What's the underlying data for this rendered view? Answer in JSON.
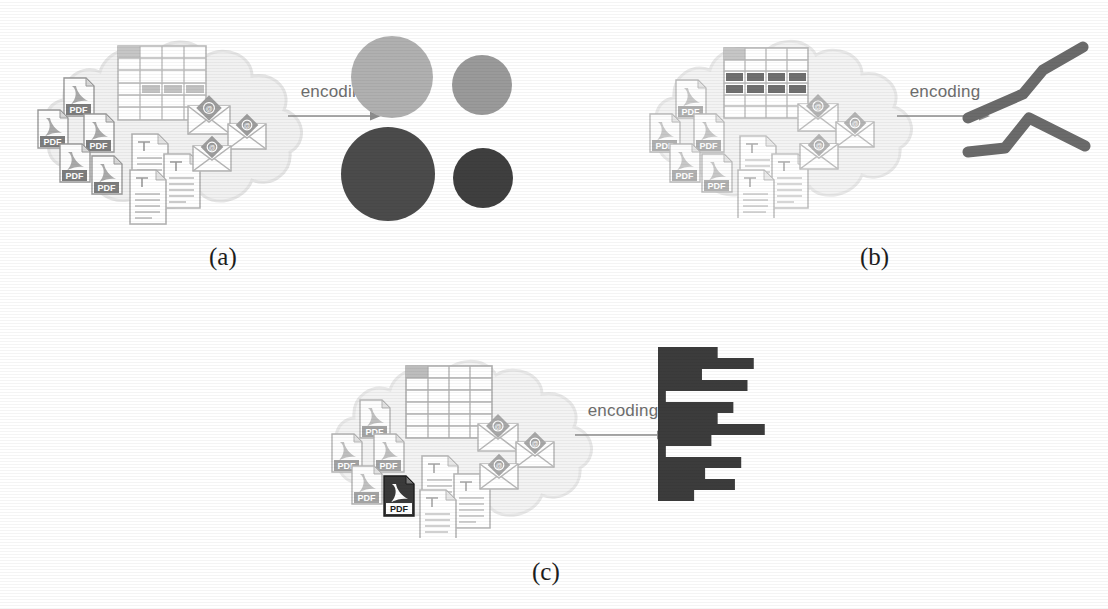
{
  "figure": {
    "caption_labels": [
      "(a)",
      "(b)",
      "(c)"
    ],
    "transform_label": "encoding",
    "background_color": "#ffffff",
    "ink_color": "#3a3a3a"
  },
  "panels": [
    {
      "id": "a",
      "label": "(a)",
      "arrow_label": "encoding",
      "source": {
        "name": "cloud-document-collection",
        "cloud_color": "#f0f0f0",
        "items": [
          {
            "type": "table",
            "label": "table-icon",
            "highlighted_rows": 0
          },
          {
            "type": "pdf",
            "label": "PDF",
            "count": 6,
            "highlighted": 0
          },
          {
            "type": "text-document",
            "label": "text-document-icon",
            "count": 4
          },
          {
            "type": "email",
            "label": "envelope-icon",
            "count": 3
          }
        ]
      },
      "output": {
        "encoding_type": "bubble",
        "name": "circle-glyph-encoding"
      },
      "chart_index": 0
    },
    {
      "id": "b",
      "label": "(b)",
      "arrow_label": "encoding",
      "source": {
        "name": "cloud-document-collection",
        "cloud_color": "#f2f2f2",
        "items": [
          {
            "type": "table",
            "label": "table-icon",
            "highlighted_rows": 2
          },
          {
            "type": "pdf",
            "label": "PDF",
            "count": 6,
            "highlighted": 0
          },
          {
            "type": "text-document",
            "label": "text-document-icon",
            "count": 4
          },
          {
            "type": "email",
            "label": "envelope-icon",
            "count": 3
          }
        ]
      },
      "output": {
        "encoding_type": "line",
        "name": "line-glyph-encoding"
      },
      "chart_index": 1
    },
    {
      "id": "c",
      "label": "(c)",
      "arrow_label": "encoding",
      "source": {
        "name": "cloud-document-collection",
        "cloud_color": "#f2f2f2",
        "items": [
          {
            "type": "table",
            "label": "table-icon",
            "highlighted_rows": 0
          },
          {
            "type": "pdf",
            "label": "PDF",
            "count": 6,
            "highlighted": 1
          },
          {
            "type": "text-document",
            "label": "text-document-icon",
            "count": 4
          },
          {
            "type": "email",
            "label": "envelope-icon",
            "count": 3
          }
        ]
      },
      "output": {
        "encoding_type": "bar",
        "name": "bar-glyph-encoding"
      },
      "chart_index": 2
    }
  ],
  "chart_data": [
    {
      "type": "scatter",
      "title": "",
      "xlabel": "",
      "ylabel": "",
      "legend": "none",
      "grid": false,
      "note": "Four filled circles (bubble glyphs) of two sizes and two gray tones",
      "points": [
        {
          "name": "circle-top-left",
          "cx": 392,
          "cy": 77,
          "r": 41,
          "color": "#b0b0b0"
        },
        {
          "name": "circle-top-right",
          "cx": 482,
          "cy": 85,
          "r": 30,
          "color": "#9a9a9a"
        },
        {
          "name": "circle-bottom-left",
          "cx": 388,
          "cy": 174,
          "r": 47,
          "color": "#4b4b4b"
        },
        {
          "name": "circle-bottom-right",
          "cx": 483,
          "cy": 178,
          "r": 30,
          "color": "#3f3f3f"
        }
      ]
    },
    {
      "type": "line",
      "title": "",
      "xlabel": "",
      "ylabel": "",
      "legend": "none",
      "grid": false,
      "stroke_color": "#6b6b6b",
      "stroke_width": 11,
      "note": "Two thick rounded polyline glyphs, upper series rising, lower series peaked",
      "series": [
        {
          "name": "upper-line",
          "points": [
            [
              968,
              118
            ],
            [
              1023,
              94
            ],
            [
              1043,
              70
            ],
            [
              1083,
              47
            ]
          ]
        },
        {
          "name": "lower-line",
          "points": [
            [
              968,
              152
            ],
            [
              1005,
              148
            ],
            [
              1029,
              118
            ],
            [
              1085,
              146
            ]
          ]
        }
      ]
    },
    {
      "type": "bar",
      "orientation": "horizontal",
      "title": "",
      "xlabel": "",
      "ylabel": "",
      "legend": "none",
      "grid": false,
      "bar_color": "#3c3c3c",
      "x_origin": 658,
      "y_top": 347,
      "bar_height": 11,
      "categories": [
        "b1",
        "b2",
        "b3",
        "b4",
        "b5",
        "b6",
        "b7",
        "b8",
        "b9",
        "b10",
        "b11",
        "b12",
        "b13",
        "b14"
      ],
      "values": [
        38,
        61,
        28,
        57,
        5,
        48,
        38,
        68,
        34,
        5,
        53,
        30,
        49,
        23
      ],
      "xlim": [
        0,
        70
      ]
    }
  ]
}
